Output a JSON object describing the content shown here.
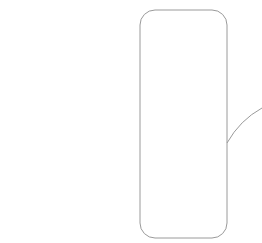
{
  "diagram": {
    "rods": [
      {
        "id": 1,
        "cubes": 10,
        "grouped": false
      },
      {
        "id": 2,
        "cubes": 10,
        "grouped": false
      },
      {
        "id": 3,
        "cubes": 10,
        "grouped": false
      },
      {
        "id": 4,
        "cubes": 10,
        "grouped": true
      },
      {
        "id": 5,
        "cubes": 10,
        "grouped": true
      }
    ],
    "group": {
      "rods": [
        4,
        5
      ],
      "shape": "rounded-rectangle"
    },
    "callout": {
      "shape": "curved-line"
    },
    "colors": {
      "stroke": "#4a4a4a",
      "side_shade": "#c8c8c8",
      "top_shade": "#dcdcdc",
      "group_stroke": "#9a9a9a"
    }
  }
}
